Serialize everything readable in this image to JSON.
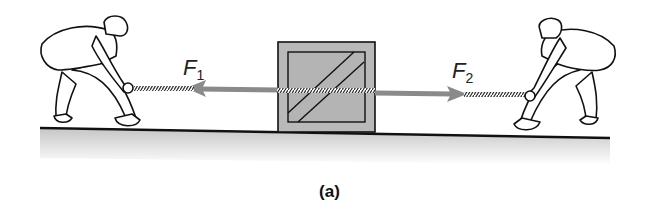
{
  "figure": {
    "caption": "(a)",
    "forces": [
      {
        "symbol": "F",
        "subscript": "1",
        "direction": "left"
      },
      {
        "symbol": "F",
        "subscript": "2",
        "direction": "right"
      }
    ],
    "objects": [
      "person-left-pulling",
      "crate",
      "rope",
      "person-right-pulling",
      "ground"
    ],
    "colors": {
      "arrow": "#8a8a8a",
      "crate_fill": "#b9b9b9",
      "outline": "#111111",
      "ground_shade": "#cfcfcf"
    }
  }
}
